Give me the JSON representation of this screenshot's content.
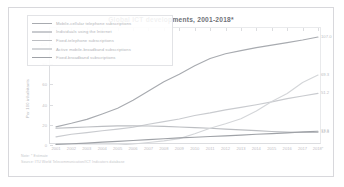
{
  "chart_data": {
    "type": "line",
    "title": "Global ICT developments, 2001-2018*",
    "xlabel": "",
    "ylabel": "Per 100 inhabitants",
    "grid": false,
    "legend_position": "upper-left",
    "ylim": [
      0,
      110
    ],
    "yticks": [
      "0",
      "20",
      "40",
      "60",
      "80",
      "100"
    ],
    "ytick_values": [
      0,
      20,
      40,
      60,
      80,
      100
    ],
    "categories": [
      "2001",
      "2002",
      "2003",
      "2004",
      "2005",
      "2006",
      "2007",
      "2008",
      "2009",
      "2010",
      "2011",
      "2012",
      "2013",
      "2014",
      "2015",
      "2016",
      "2017",
      "2018*"
    ],
    "series": [
      {
        "name": "Mobile-cellular telephone subscriptions",
        "color": "#a8abb0",
        "values": [
          18.0,
          21.5,
          25.4,
          30.8,
          36.5,
          44.3,
          53.4,
          62.6,
          70.2,
          78.5,
          85.7,
          90.4,
          93.5,
          96.5,
          99.0,
          101.5,
          104.0,
          107.0
        ],
        "end_label": "107.0"
      },
      {
        "name": "Individuals using the Internet",
        "color": "#c9cbcf",
        "values": [
          8.0,
          10.6,
          12.3,
          14.1,
          15.8,
          17.6,
          20.6,
          23.1,
          25.8,
          29.2,
          31.8,
          34.8,
          37.3,
          39.9,
          42.7,
          45.9,
          48.6,
          51.2
        ],
        "end_label": "51.2"
      },
      {
        "name": "Fixed-telephone subscriptions",
        "color": "#bcbec2",
        "values": [
          16.6,
          17.2,
          17.8,
          18.5,
          19.0,
          19.1,
          18.8,
          18.5,
          17.8,
          17.2,
          16.6,
          15.8,
          15.0,
          14.2,
          13.4,
          12.8,
          12.4,
          12.4
        ],
        "end_label": "12.4"
      },
      {
        "name": "Active mobile-broadband subscriptions",
        "color": "#d4d6d9",
        "values": [
          0.0,
          0.0,
          0.0,
          0.0,
          0.0,
          1.0,
          2.5,
          4.1,
          6.3,
          11.1,
          16.6,
          21.1,
          26.0,
          33.6,
          43.0,
          51.0,
          61.9,
          69.3
        ],
        "end_label": "69.3"
      },
      {
        "name": "Fixed-broadband subscriptions",
        "color": "#9fa2a7",
        "values": [
          0.6,
          1.2,
          1.9,
          2.8,
          3.6,
          4.5,
          5.3,
          6.2,
          7.0,
          7.7,
          8.4,
          9.1,
          9.8,
          10.6,
          11.3,
          12.0,
          13.0,
          13.6
        ],
        "end_label": "13.6"
      }
    ],
    "end_labels": [
      {
        "text": "107.0",
        "value": 107.0
      },
      {
        "text": "69.3",
        "value": 69.3
      },
      {
        "text": "51.2",
        "value": 51.2
      },
      {
        "text": "13.6",
        "value": 13.6
      },
      {
        "text": "12.4",
        "value": 12.4
      }
    ]
  },
  "footnotes": {
    "note": "Note: * Estimate",
    "source": "Source: ITU World Telecommunication/ICT Indicators database"
  }
}
